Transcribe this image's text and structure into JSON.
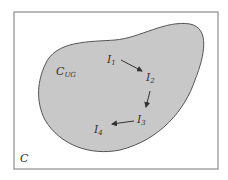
{
  "diagram": {
    "outer_set_label": "C",
    "region_label_main": "C",
    "region_label_sub": "UG",
    "nodes": [
      {
        "id": "I1",
        "main": "I",
        "sub": "1"
      },
      {
        "id": "I2",
        "main": "I",
        "sub": "2"
      },
      {
        "id": "I3",
        "main": "I",
        "sub": "3"
      },
      {
        "id": "I4",
        "main": "I",
        "sub": "4"
      }
    ],
    "edges": [
      {
        "from": "I1",
        "to": "I2"
      },
      {
        "from": "I2",
        "to": "I3"
      },
      {
        "from": "I3",
        "to": "I4"
      }
    ],
    "colors": {
      "region_fill": "#c8c8c8",
      "stroke": "#555555",
      "frame": "#777777"
    }
  }
}
